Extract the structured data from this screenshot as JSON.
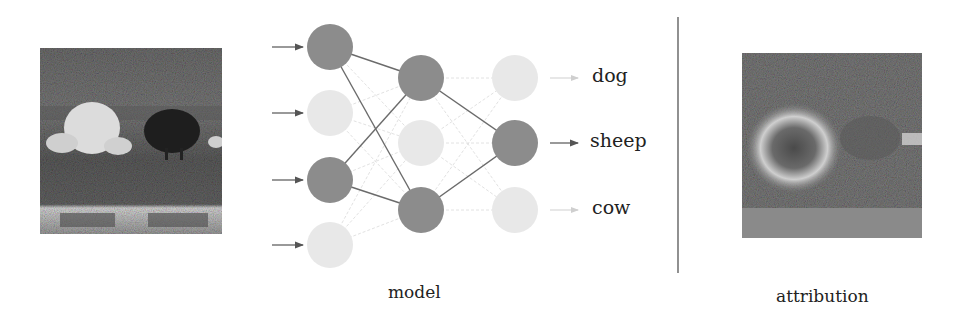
{
  "figure": {
    "input_image": {
      "description": "grayscale photo of white and black sheep on grass near water"
    },
    "attribution_image": {
      "description": "attribution heatmap highlighting the white sheep"
    },
    "captions": {
      "model": "model",
      "attribution": "attribution"
    },
    "outputs": [
      {
        "label": "dog",
        "active": false
      },
      {
        "label": "sheep",
        "active": true
      },
      {
        "label": "cow",
        "active": false
      }
    ],
    "network": {
      "layers": [
        {
          "name": "input",
          "nodes": [
            true,
            false,
            true,
            false
          ]
        },
        {
          "name": "hidden",
          "nodes": [
            true,
            false,
            true
          ]
        },
        {
          "name": "output",
          "nodes": [
            false,
            true,
            false
          ]
        }
      ],
      "colors": {
        "active": "#8c8c8c",
        "inactive": "#e6e6e6",
        "active_edge": "#6b6b6b",
        "inactive_edge": "#e0e0e0"
      }
    }
  }
}
